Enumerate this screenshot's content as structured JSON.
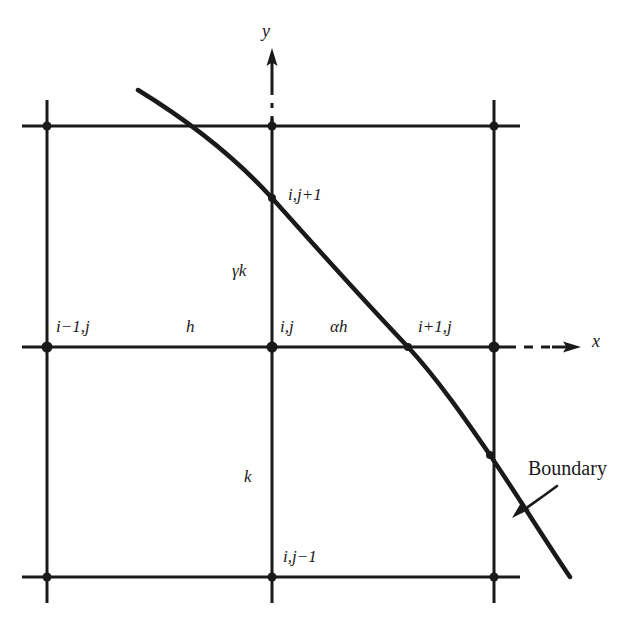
{
  "figure": {
    "background_color": "#ffffff",
    "line_color": "#1a1a1a",
    "width": 636,
    "height": 626
  },
  "axes": {
    "y_label": "y",
    "x_label": "x",
    "y_axis_name": "y-axis-arrow",
    "x_axis_name": "x-axis-arrow"
  },
  "grid": {
    "vertical_lines_x": [
      47,
      272,
      494
    ],
    "horizontal_lines_y": [
      126,
      347,
      577
    ],
    "node_count": 9
  },
  "labels": {
    "node_i_minus_1_j": "i−1,j",
    "node_i_j": "i,j",
    "node_i_plus_1_j": "i+1,j",
    "node_i_j_plus_1": "i,j+1",
    "node_i_j_minus_1": "i,j−1",
    "spacing_h": "h",
    "spacing_alpha_h": "αh",
    "spacing_gamma_k": "γk",
    "spacing_k": "k",
    "boundary": "Boundary"
  },
  "boundary_curve": {
    "name": "boundary-curve",
    "start": [
      138,
      90
    ],
    "end": [
      570,
      577
    ],
    "crossings": [
      {
        "label": "i,j+1",
        "point": [
          272,
          198
        ]
      },
      {
        "label": "i+1,j",
        "point": [
          408,
          347
        ]
      },
      {
        "label": "right-grid-line",
        "point": [
          490,
          455
        ]
      }
    ]
  },
  "annotation": {
    "arrow_name": "boundary-callout-arrow",
    "arrow_from": [
      557,
      486
    ],
    "arrow_to": [
      516,
      516
    ]
  }
}
